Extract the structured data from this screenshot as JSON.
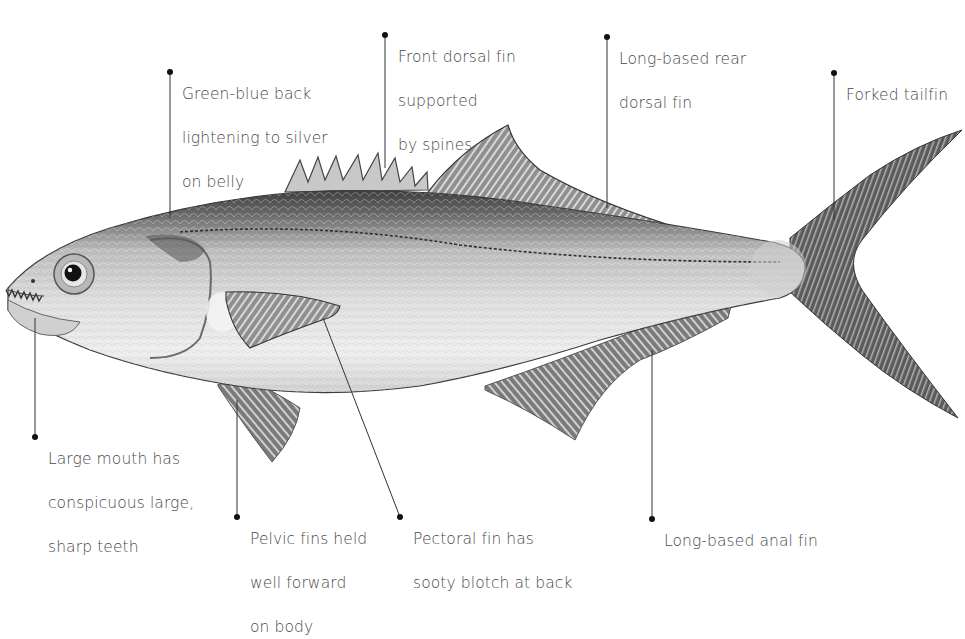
{
  "diagram": {
    "colors": {
      "text": "#4a4a4a",
      "leader": "#333333",
      "body_light": "#e6e6e6",
      "body_dark": "#5a5a5a",
      "fin": "#8a8a8a",
      "background": "#ffffff"
    },
    "labels": [
      {
        "id": "back",
        "lines": [
          "Green-blue back",
          "lightening to silver",
          "on belly"
        ]
      },
      {
        "id": "front-dorsal",
        "lines": [
          "Front dorsal fin",
          "supported",
          "by spines"
        ]
      },
      {
        "id": "rear-dorsal",
        "lines": [
          "Long-based rear",
          "dorsal fin"
        ]
      },
      {
        "id": "tail",
        "lines": [
          "Forked tailfin"
        ]
      },
      {
        "id": "mouth",
        "lines": [
          "Large mouth has",
          "conspicuous large,",
          "sharp teeth"
        ]
      },
      {
        "id": "pelvic",
        "lines": [
          "Pelvic fins held",
          "well forward",
          "on body"
        ]
      },
      {
        "id": "pectoral",
        "lines": [
          "Pectoral fin has",
          "sooty blotch at back"
        ]
      },
      {
        "id": "anal",
        "lines": [
          "Long-based anal fin"
        ]
      }
    ]
  }
}
